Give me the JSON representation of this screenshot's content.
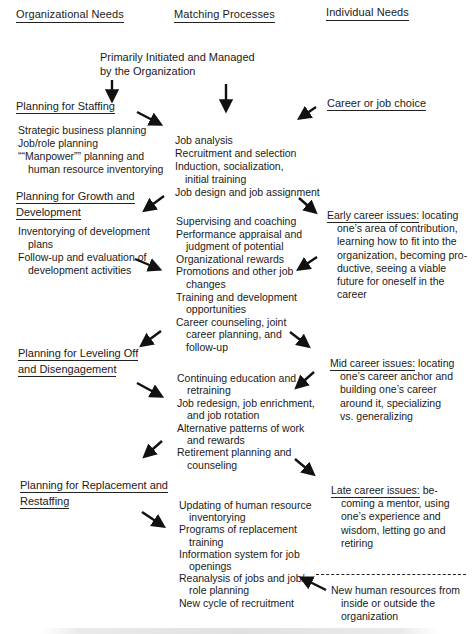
{
  "columns": {
    "organizational": "Organizational Needs",
    "matching": "Matching Processes",
    "individual": "Individual Needs"
  },
  "top_note": {
    "line1": "Primarily Initiated and Managed",
    "line2": "by the Organization"
  },
  "organizational": [
    {
      "heading": [
        "Planning for Staffing"
      ],
      "items": [
        {
          "text": "Strategic business planning",
          "indent": false
        },
        {
          "text": "Job/role planning",
          "indent": false
        },
        {
          "text": "““Manpower”” planning and",
          "indent": false
        },
        {
          "text": "human resource inventorying",
          "indent": true
        }
      ]
    },
    {
      "heading": [
        "Planning for Growth and",
        "Development"
      ],
      "items": [
        {
          "text": "Inventorying of development",
          "indent": false
        },
        {
          "text": "plans",
          "indent": true
        },
        {
          "text": "Follow-up and evaluation of",
          "indent": false
        },
        {
          "text": "development activities",
          "indent": true
        }
      ]
    },
    {
      "heading": [
        "Planning for Leveling Off",
        "and Disengagement"
      ],
      "items": []
    },
    {
      "heading": [
        "Planning for Replacement and",
        "Restaffing"
      ],
      "items": []
    }
  ],
  "matching": [
    {
      "items": [
        {
          "text": "Job analysis",
          "indent": false
        },
        {
          "text": "Recruitment and selection",
          "indent": false
        },
        {
          "text": "Induction, socialization,",
          "indent": false
        },
        {
          "text": "initial training",
          "indent": true
        },
        {
          "text": "Job design and job assignment",
          "indent": false
        }
      ]
    },
    {
      "items": [
        {
          "text": "Supervising and coaching",
          "indent": false
        },
        {
          "text": "Performance appraisal and",
          "indent": false
        },
        {
          "text": "judgment of potential",
          "indent": true
        },
        {
          "text": "Organizational rewards",
          "indent": false
        },
        {
          "text": "Promotions and other job",
          "indent": false
        },
        {
          "text": "changes",
          "indent": true
        },
        {
          "text": "Training and development",
          "indent": false
        },
        {
          "text": "opportunities",
          "indent": true
        },
        {
          "text": "Career counseling, joint",
          "indent": false
        },
        {
          "text": "career planning, and",
          "indent": true
        },
        {
          "text": "follow-up",
          "indent": true
        }
      ]
    },
    {
      "items": [
        {
          "text": "Continuing education and",
          "indent": false
        },
        {
          "text": "retraining",
          "indent": true
        },
        {
          "text": "Job redesign, job enrichment,",
          "indent": false
        },
        {
          "text": "and job rotation",
          "indent": true
        },
        {
          "text": "Alternative patterns of work",
          "indent": false
        },
        {
          "text": "and rewards",
          "indent": true
        },
        {
          "text": "Retirement planning and",
          "indent": false
        },
        {
          "text": "counseling",
          "indent": true
        }
      ]
    },
    {
      "items": [
        {
          "text": "Updating of human resource",
          "indent": false
        },
        {
          "text": "inventorying",
          "indent": true
        },
        {
          "text": "Programs of replacement",
          "indent": false
        },
        {
          "text": "training",
          "indent": true
        },
        {
          "text": "Information system for job",
          "indent": false
        },
        {
          "text": "openings",
          "indent": true
        },
        {
          "text": "Reanalysis of jobs and job/",
          "indent": false
        },
        {
          "text": "role planning",
          "indent": true
        },
        {
          "text": "New cycle of recruitment",
          "indent": false
        }
      ]
    }
  ],
  "individual": [
    {
      "heading": "Career or job choice",
      "rest": "",
      "lines": []
    },
    {
      "heading": "Early career issues:",
      "rest": " locating",
      "lines": [
        "one’s area of contribution,",
        "learning how to fit into the",
        "organization, becoming pro-",
        "ductive, seeing a viable",
        "future for oneself in the",
        "career"
      ]
    },
    {
      "heading": "Mid career issues:",
      "rest": " locating",
      "lines": [
        "one’s career anchor and",
        "building one’s career",
        "around it, specializing",
        "vs. generalizing"
      ]
    },
    {
      "heading": "Late career issues:",
      "rest": " be-",
      "lines": [
        "coming a mentor, using",
        "one’s experience and",
        "wisdom, letting go and",
        "retiring"
      ]
    }
  ],
  "new_resources": {
    "lines": [
      "New human resources from",
      "inside or outside the",
      "organization"
    ]
  },
  "colors": {
    "ink": "#1a1a1a",
    "background": "#ffffff"
  }
}
